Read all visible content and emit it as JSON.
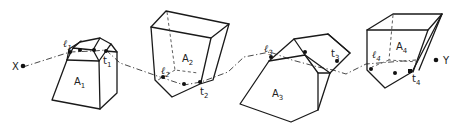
{
  "diagram": {
    "ray": {
      "start_label": "X",
      "end_label": "Y"
    },
    "bodies": [
      {
        "name": "A",
        "sub": "1",
        "entry": {
          "name": "ℓ",
          "sub": "1"
        },
        "exit": {
          "name": "t",
          "sub": "1"
        }
      },
      {
        "name": "A",
        "sub": "2",
        "entry": {
          "name": "ℓ",
          "sub": "2"
        },
        "exit": {
          "name": "t",
          "sub": "2"
        }
      },
      {
        "name": "A",
        "sub": "3",
        "entry": {
          "name": "ℓ",
          "sub": "3"
        },
        "exit": {
          "name": "t",
          "sub": "3"
        }
      },
      {
        "name": "A",
        "sub": "4",
        "entry": {
          "name": "ℓ",
          "sub": "4"
        },
        "exit": {
          "name": "t",
          "sub": "4"
        }
      }
    ]
  }
}
